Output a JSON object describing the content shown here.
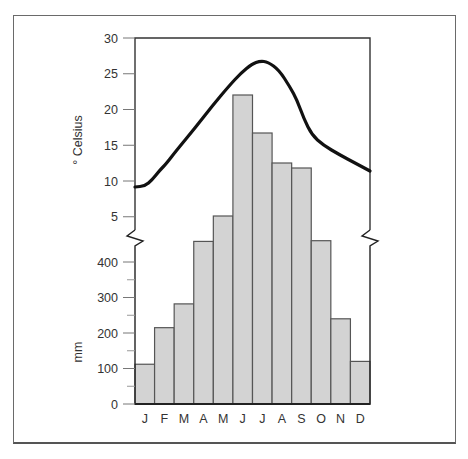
{
  "chart_data": {
    "type": "bar+line",
    "title": "",
    "categories": [
      "J",
      "F",
      "M",
      "A",
      "M",
      "J",
      "J",
      "A",
      "S",
      "O",
      "N",
      "D"
    ],
    "series": [
      {
        "name": "Temperature",
        "kind": "line",
        "unit": "° Celsius",
        "values": [
          9,
          12,
          17,
          21.5,
          25.5,
          27,
          26,
          23,
          16,
          13.5,
          12.5,
          11.2
        ]
      },
      {
        "name": "Precipitation",
        "kind": "bar",
        "unit": "mm",
        "values": [
          112,
          215,
          282,
          458,
          530,
          715,
          640,
          595,
          585,
          460,
          240,
          120
        ]
      }
    ],
    "temperature_axis": {
      "label": "° Celsius",
      "ticks": [
        5,
        10,
        15,
        20,
        25,
        30
      ],
      "ylim": [
        3,
        30
      ]
    },
    "precipitation_axis": {
      "label": "mm",
      "ticks": [
        0,
        100,
        200,
        300,
        400
      ],
      "ylim": [
        0,
        440
      ]
    },
    "axis_break": true,
    "grid": false,
    "legend": "none",
    "colors": {
      "bar_fill": "#d3d3d3",
      "bar_stroke": "#555555",
      "line": "#111111",
      "axis": "#333333"
    }
  },
  "labels": {
    "temp_axis_title": "° Celsius",
    "precip_axis_title": "mm",
    "temp_ticks": [
      "30",
      "25",
      "20",
      "15",
      "10",
      "5"
    ],
    "precip_ticks": [
      "400",
      "300",
      "200",
      "100",
      "0"
    ],
    "months": [
      "J",
      "F",
      "M",
      "A",
      "M",
      "J",
      "J",
      "A",
      "S",
      "O",
      "N",
      "D"
    ]
  }
}
